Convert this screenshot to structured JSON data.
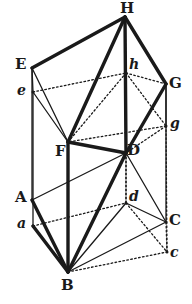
{
  "figure": {
    "kind": "geometry-line-drawing",
    "canvas": {
      "width": 192,
      "height": 304
    },
    "ink_color": "#1a1a1a",
    "background_color": "#ffffff"
  },
  "vertices": [
    {
      "id": "H",
      "label": "H",
      "case": "upper",
      "x": 125,
      "y": 17,
      "label_x": 120,
      "label_y": 1
    },
    {
      "id": "E",
      "label": "E",
      "case": "upper",
      "x": 32,
      "y": 68,
      "label_x": 15,
      "label_y": 57
    },
    {
      "id": "e",
      "label": "e",
      "case": "lower",
      "x": 33,
      "y": 92,
      "label_x": 17,
      "label_y": 83
    },
    {
      "id": "h",
      "label": "h",
      "case": "lower",
      "x": 126,
      "y": 73,
      "label_x": 129,
      "label_y": 57
    },
    {
      "id": "G",
      "label": "G",
      "case": "upper",
      "x": 166,
      "y": 84,
      "label_x": 169,
      "label_y": 76
    },
    {
      "id": "g",
      "label": "g",
      "case": "lower",
      "x": 166,
      "y": 126,
      "label_x": 170,
      "label_y": 116
    },
    {
      "id": "F",
      "label": "F",
      "case": "upper",
      "x": 68,
      "y": 142,
      "label_x": 55,
      "label_y": 144
    },
    {
      "id": "D",
      "label": "D",
      "case": "upper",
      "x": 126,
      "y": 153,
      "label_x": 127,
      "label_y": 143
    },
    {
      "id": "d",
      "label": "d",
      "case": "lower",
      "x": 126,
      "y": 203,
      "label_x": 129,
      "label_y": 189
    },
    {
      "id": "A",
      "label": "A",
      "case": "upper",
      "x": 32,
      "y": 200,
      "label_x": 15,
      "label_y": 190
    },
    {
      "id": "a",
      "label": "a",
      "case": "lower",
      "x": 33,
      "y": 226,
      "label_x": 17,
      "label_y": 216
    },
    {
      "id": "C",
      "label": "C",
      "case": "upper",
      "x": 166,
      "y": 222,
      "label_x": 169,
      "label_y": 213
    },
    {
      "id": "c",
      "label": "c",
      "case": "lower",
      "x": 167,
      "y": 252,
      "label_x": 170,
      "label_y": 245
    },
    {
      "id": "B",
      "label": "B",
      "case": "upper",
      "x": 68,
      "y": 272,
      "label_x": 61,
      "label_y": 278
    }
  ],
  "edges": [
    {
      "from": "E",
      "to": "H",
      "style": "heavy"
    },
    {
      "from": "H",
      "to": "G",
      "style": "heavy"
    },
    {
      "from": "E",
      "to": "F",
      "style": "solid"
    },
    {
      "from": "F",
      "to": "H",
      "style": "heavy"
    },
    {
      "from": "H",
      "to": "D",
      "style": "heavy"
    },
    {
      "from": "F",
      "to": "D",
      "style": "heavy"
    },
    {
      "from": "D",
      "to": "G",
      "style": "heavy"
    },
    {
      "from": "e",
      "to": "E",
      "style": "solid"
    },
    {
      "from": "e",
      "to": "F",
      "style": "solid"
    },
    {
      "from": "e",
      "to": "h",
      "style": "dotted"
    },
    {
      "from": "h",
      "to": "H",
      "style": "dotted"
    },
    {
      "from": "h",
      "to": "F",
      "style": "dotted"
    },
    {
      "from": "h",
      "to": "G",
      "style": "dotted"
    },
    {
      "from": "h",
      "to": "g",
      "style": "dotted"
    },
    {
      "from": "h",
      "to": "D",
      "style": "dotted"
    },
    {
      "from": "g",
      "to": "G",
      "style": "solid"
    },
    {
      "from": "g",
      "to": "F",
      "style": "dotted"
    },
    {
      "from": "g",
      "to": "D",
      "style": "dotted"
    },
    {
      "from": "E",
      "to": "A",
      "style": "solid"
    },
    {
      "from": "e",
      "to": "a",
      "style": "solid"
    },
    {
      "from": "F",
      "to": "B",
      "style": "heavy"
    },
    {
      "from": "G",
      "to": "C",
      "style": "solid"
    },
    {
      "from": "g",
      "to": "c",
      "style": "dotted"
    },
    {
      "from": "D",
      "to": "d",
      "style": "dotted"
    },
    {
      "from": "A",
      "to": "B",
      "style": "heavy"
    },
    {
      "from": "A",
      "to": "D",
      "style": "solid"
    },
    {
      "from": "a",
      "to": "B",
      "style": "heavy"
    },
    {
      "from": "a",
      "to": "d",
      "style": "dotted"
    },
    {
      "from": "B",
      "to": "D",
      "style": "heavy"
    },
    {
      "from": "B",
      "to": "d",
      "style": "solid"
    },
    {
      "from": "B",
      "to": "C",
      "style": "solid"
    },
    {
      "from": "B",
      "to": "c",
      "style": "dotted"
    },
    {
      "from": "d",
      "to": "D",
      "style": "dotted"
    },
    {
      "from": "d",
      "to": "C",
      "style": "solid"
    },
    {
      "from": "d",
      "to": "c",
      "style": "dotted"
    },
    {
      "from": "D",
      "to": "C",
      "style": "solid"
    },
    {
      "from": "c",
      "to": "C",
      "style": "dotted"
    }
  ]
}
